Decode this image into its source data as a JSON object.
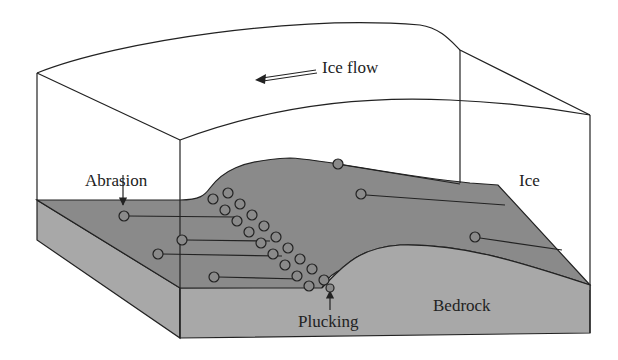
{
  "labels": {
    "ice_flow": "Ice flow",
    "ice": "Ice",
    "abrasion": "Abrasion",
    "bedrock": "Bedrock",
    "plucking": "Plucking"
  },
  "arrows": {
    "ice_flow_direction": "left",
    "abrasion_pointer": "down",
    "plucking_pointer": "up"
  },
  "colors": {
    "outline": "#222222",
    "bedrock_top": "#8c8c8c",
    "bedrock_side": "#aaaaaa",
    "ice": "#ffffff"
  },
  "clasts": {
    "abrasion_tracks": 7,
    "plucked_block_rows": 2
  }
}
